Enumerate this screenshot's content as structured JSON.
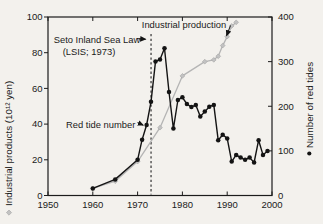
{
  "figure": {
    "background": "#f3f1ed",
    "ink_color": "#1a1a1a",
    "gray_color": "#b5b5b5",
    "annotations": {
      "law_line1": "Seto Inland Sea Law",
      "law_line2": "(LSIS; 1973)",
      "industrial_label": "Industrial production",
      "red_tide_label": "Red tide number"
    }
  },
  "chart_data": {
    "type": "line",
    "title": "",
    "xlabel": "",
    "ylabel_left": "Industrial products (10¹² yen)",
    "ylabel_right": "Number of red tides",
    "xlim": [
      1950,
      2000
    ],
    "ylim_left": [
      0,
      100
    ],
    "ylim_right": [
      0,
      400
    ],
    "xticks": [
      1950,
      1960,
      1970,
      1980,
      1990,
      2000
    ],
    "yticks_left": [
      0,
      20,
      40,
      60,
      80,
      100
    ],
    "yticks_right": [
      0,
      100,
      200,
      300,
      400
    ],
    "grid": false,
    "legend_position": "none",
    "vline": {
      "x": 1973,
      "style": "dashed",
      "label": "Seto Inland Sea Law (LSIS; 1973)"
    },
    "series": [
      {
        "name": "Industrial production",
        "axis": "left",
        "color": "#b5b5b5",
        "marker": "diamond",
        "marker_color": "#c2c2c2",
        "points": [
          [
            1960,
            4
          ],
          [
            1965,
            8
          ],
          [
            1970,
            19
          ],
          [
            1975,
            38
          ],
          [
            1980,
            67
          ],
          [
            1985,
            75
          ],
          [
            1987,
            76
          ],
          [
            1988,
            78
          ],
          [
            1989,
            84
          ],
          [
            1990,
            89
          ],
          [
            1991,
            95
          ],
          [
            1992,
            97
          ]
        ]
      },
      {
        "name": "Red tide number",
        "axis": "right",
        "color": "#141414",
        "marker": "circle",
        "marker_color": "#141414",
        "points": [
          [
            1960,
            16
          ],
          [
            1965,
            36
          ],
          [
            1970,
            80
          ],
          [
            1971,
            125
          ],
          [
            1972,
            158
          ],
          [
            1973,
            210
          ],
          [
            1974,
            300
          ],
          [
            1975,
            305
          ],
          [
            1976,
            330
          ],
          [
            1977,
            232
          ],
          [
            1978,
            150
          ],
          [
            1979,
            214
          ],
          [
            1980,
            220
          ],
          [
            1981,
            205
          ],
          [
            1982,
            198
          ],
          [
            1983,
            203
          ],
          [
            1984,
            177
          ],
          [
            1985,
            188
          ],
          [
            1986,
            199
          ],
          [
            1987,
            203
          ],
          [
            1988,
            124
          ],
          [
            1989,
            136
          ],
          [
            1990,
            128
          ],
          [
            1991,
            76
          ],
          [
            1992,
            91
          ],
          [
            1993,
            85
          ],
          [
            1994,
            80
          ],
          [
            1995,
            85
          ],
          [
            1996,
            74
          ],
          [
            1997,
            124
          ],
          [
            1998,
            91
          ],
          [
            1999,
            100
          ]
        ]
      }
    ]
  }
}
